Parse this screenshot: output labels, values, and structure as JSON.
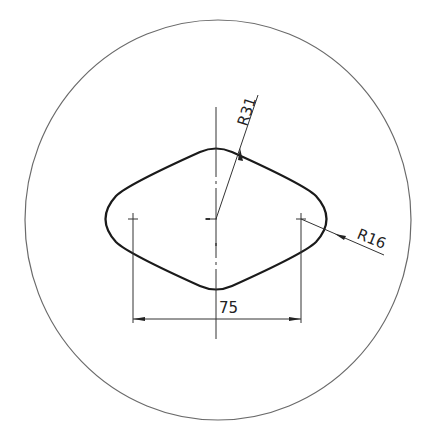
{
  "drawing": {
    "outer_circle": {
      "cx": 218,
      "cy": 220,
      "rx": 193,
      "ry": 200,
      "stroke": "#666666"
    },
    "slot_outline_stroke": "#1a1a1a",
    "centers": {
      "left": [
        133,
        219
      ],
      "middle": [
        216,
        219
      ],
      "right": [
        301,
        219
      ]
    },
    "dimensions": {
      "large_radius": "R31",
      "small_radius": "R16",
      "center_distance": "75"
    }
  }
}
